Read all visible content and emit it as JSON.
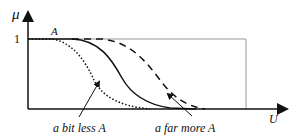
{
  "diagram": {
    "y_axis_label": "μ",
    "x_axis_label": "U",
    "y_tick_one": "1",
    "fuzzy_set_label": "A",
    "annotations": {
      "less": "a bit less A",
      "more": "a far more A"
    },
    "curves": [
      {
        "name": "A",
        "style": "solid"
      },
      {
        "name": "a bit less A",
        "style": "dotted"
      },
      {
        "name": "a far more A",
        "style": "dashed"
      }
    ],
    "colors": {
      "ink": "#111111",
      "frame": "#999999"
    }
  }
}
